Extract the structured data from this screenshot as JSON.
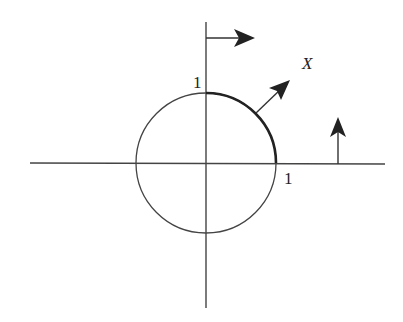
{
  "diagram": {
    "labels": {
      "y_tick": "1",
      "x_tick": "1",
      "vector_field": "X"
    },
    "colors": {
      "stroke": "#333333",
      "arc": "#222222",
      "background": "#ffffff"
    },
    "elements": [
      "horizontal-axis",
      "vertical-axis",
      "unit-circle",
      "highlighted-quarter-arc",
      "arrow-on-vertical-axis",
      "vector-X-on-circle",
      "arrow-on-horizontal-axis"
    ]
  }
}
